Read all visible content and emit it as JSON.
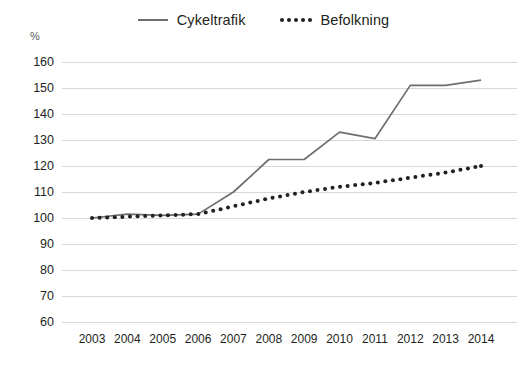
{
  "chart_data": {
    "type": "line",
    "title": "",
    "subtitle": "",
    "xlabel": "",
    "ylabel": "%",
    "unit_label": "%",
    "categories": [
      "2003",
      "2004",
      "2005",
      "2006",
      "2007",
      "2008",
      "2009",
      "2010",
      "2011",
      "2012",
      "2013",
      "2014"
    ],
    "x": [
      2003,
      2004,
      2005,
      2006,
      2007,
      2008,
      2009,
      2010,
      2011,
      2012,
      2013,
      2014
    ],
    "ylim": [
      60,
      160
    ],
    "ytick_values": [
      160,
      150,
      140,
      130,
      120,
      110,
      100,
      90,
      80,
      70,
      60
    ],
    "ytick_labels": [
      "160",
      "150",
      "140",
      "130",
      "120",
      "110",
      "100",
      "90",
      "80",
      "70",
      "60"
    ],
    "ytick_step": 10,
    "grid": true,
    "grid_axis": "y",
    "legend_position": "top-center",
    "series": [
      {
        "name": "Cykeltrafik",
        "style": "solid",
        "color": "#6d6e70",
        "values": [
          100,
          101.5,
          101,
          101.5,
          110,
          122.5,
          122.5,
          133,
          130.5,
          151,
          151,
          153
        ]
      },
      {
        "name": "Befolkning",
        "style": "dotted",
        "color": "#231f20",
        "values": [
          100,
          100.5,
          101,
          101.5,
          104.5,
          107.5,
          110,
          112,
          113.5,
          115.5,
          117.5,
          120
        ]
      }
    ],
    "colors": {
      "cykeltrafik": "#6d6e70",
      "befolkning": "#231f20",
      "gridline": "#d7d8da",
      "background": "#ffffff",
      "text": "#231f20"
    }
  },
  "legend": {
    "items": [
      {
        "label": "Cykeltrafik",
        "marker": "solid-line-icon"
      },
      {
        "label": "Befolkning",
        "marker": "dotted-line-icon"
      }
    ]
  }
}
